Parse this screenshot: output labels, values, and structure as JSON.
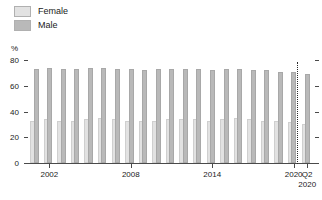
{
  "chart_data": {
    "type": "bar",
    "title": "",
    "subtitle": "",
    "xlabel": "",
    "ylabel": "%",
    "ylim": [
      0,
      80
    ],
    "yticks": [
      0,
      20,
      40,
      60,
      80
    ],
    "grid": false,
    "legend_position": "top-left",
    "unit": "%",
    "categories": [
      "2001",
      "2002",
      "2003",
      "2004",
      "2005",
      "2006",
      "2007",
      "2008",
      "2009",
      "2010",
      "2011",
      "2012",
      "2013",
      "2014",
      "2015",
      "2016",
      "2017",
      "2018",
      "2019",
      "2020",
      "Q2 2020"
    ],
    "xtick_labels": [
      "2002",
      "2008",
      "2014",
      "2020",
      "Q2\n2020"
    ],
    "xtick_categories": [
      "2002",
      "2008",
      "2014",
      "2020",
      "Q2 2020"
    ],
    "series": [
      {
        "name": "Female",
        "color": "#e2e2e2",
        "values": [
          33,
          34,
          33,
          33,
          34,
          35,
          34,
          33,
          33,
          33,
          34,
          34,
          34,
          33,
          34,
          35,
          34,
          33,
          33,
          32,
          30
        ]
      },
      {
        "name": "Male",
        "color": "#b9b9b9",
        "values": [
          73,
          74,
          73,
          73,
          74,
          74,
          73,
          73,
          72,
          73,
          73,
          73,
          73,
          72,
          73,
          73,
          72,
          72,
          71,
          71,
          69
        ]
      }
    ],
    "annotations": [
      {
        "type": "divider",
        "style": "dotted",
        "after_category": "2020",
        "label": "separates annual series from Q2 2020"
      }
    ]
  },
  "legend": {
    "items": [
      {
        "label": "Female",
        "color": "#e2e2e2"
      },
      {
        "label": "Male",
        "color": "#b9b9b9"
      }
    ]
  },
  "axes": {
    "y_unit": "%",
    "y_ticks": [
      "80",
      "60",
      "40",
      "20",
      "0"
    ],
    "x_ticks": [
      "2002",
      "2008",
      "2014",
      "2020",
      "Q2\n2020"
    ]
  }
}
